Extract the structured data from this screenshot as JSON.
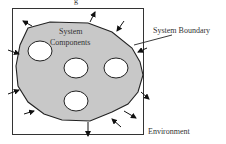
{
  "diagram": {
    "partial_top_text": "g",
    "labels": {
      "components_line1": "System",
      "components_line2": "Components",
      "boundary": "System Boundary",
      "environment": "Environment"
    },
    "colors": {
      "system_fill": "#c8c8c8",
      "component_fill": "#ffffff",
      "stroke": "#222222",
      "background": "#ffffff"
    },
    "components_count": 4,
    "arrows": {
      "inbound": 7,
      "outbound": 6
    }
  }
}
